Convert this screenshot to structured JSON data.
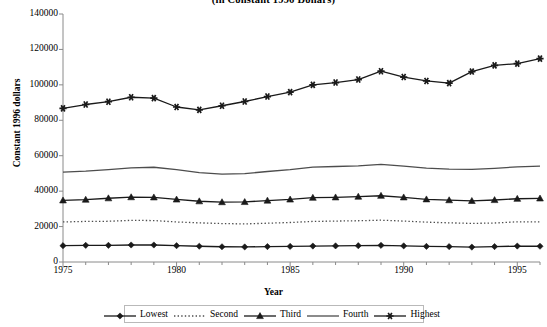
{
  "chart_data": {
    "type": "line",
    "title": "(in Constant 1996 Dollars)",
    "xlabel": "Year",
    "ylabel": "Constant 1996 dollars",
    "xlim": [
      1975,
      1996
    ],
    "ylim": [
      0,
      140000
    ],
    "ytick_step": 20000,
    "yticks": [
      "0",
      "20000",
      "40000",
      "60000",
      "80000",
      "100000",
      "120000",
      "140000"
    ],
    "ytick_values": [
      0,
      20000,
      40000,
      60000,
      80000,
      100000,
      120000,
      140000
    ],
    "xticks": [
      "1975",
      "1980",
      "1985",
      "1990",
      "1995"
    ],
    "xtick_values": [
      1975,
      1980,
      1985,
      1990,
      1995
    ],
    "grid": false,
    "legend_position": "bottom",
    "x": [
      1975,
      1976,
      1977,
      1978,
      1979,
      1980,
      1981,
      1982,
      1983,
      1984,
      1985,
      1986,
      1987,
      1988,
      1989,
      1990,
      1991,
      1992,
      1993,
      1994,
      1995,
      1996
    ],
    "series": [
      {
        "name": "Lowest",
        "marker": "diamond",
        "line": "solid",
        "color": "#1a1a1a",
        "values": [
          9200,
          9400,
          9400,
          9600,
          9600,
          9200,
          8900,
          8600,
          8500,
          8700,
          8800,
          9000,
          9100,
          9200,
          9400,
          9100,
          8800,
          8700,
          8400,
          8700,
          9000,
          8900
        ]
      },
      {
        "name": "Second",
        "marker": "none",
        "line": "dotted",
        "color": "#4d4d4d",
        "values": [
          22600,
          22900,
          23000,
          23500,
          23400,
          22600,
          22100,
          21700,
          21500,
          21900,
          22300,
          22900,
          23100,
          23300,
          23600,
          23100,
          22500,
          22100,
          21800,
          22000,
          22700,
          22600
        ]
      },
      {
        "name": "Third",
        "marker": "triangle",
        "line": "solid",
        "color": "#1a1a1a",
        "values": [
          34800,
          35200,
          36000,
          36600,
          36500,
          35300,
          34300,
          33800,
          33900,
          34700,
          35300,
          36300,
          36500,
          36900,
          37400,
          36500,
          35400,
          34900,
          34500,
          35000,
          35700,
          35900
        ]
      },
      {
        "name": "Fourth",
        "marker": "none",
        "line": "solid",
        "color": "#4d4d4d",
        "values": [
          50700,
          51300,
          52200,
          53100,
          53500,
          52100,
          50500,
          49600,
          49900,
          51100,
          52200,
          53600,
          53900,
          54300,
          55100,
          54100,
          53000,
          52400,
          52300,
          52900,
          53700,
          54100
        ]
      },
      {
        "name": "Highest",
        "marker": "star",
        "line": "solid",
        "color": "#1a1a1a",
        "values": [
          86700,
          88900,
          90500,
          93000,
          92500,
          87500,
          85900,
          88200,
          90600,
          93400,
          95900,
          100000,
          101300,
          103000,
          107700,
          104400,
          102200,
          101000,
          107500,
          111000,
          112000,
          114800
        ]
      }
    ]
  }
}
